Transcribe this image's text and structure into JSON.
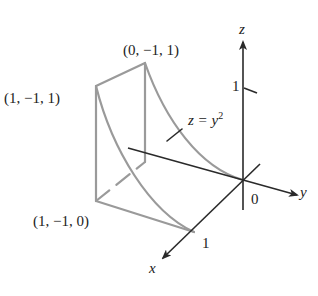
{
  "figure": {
    "type": "3d-region-sketch",
    "colors": {
      "axis": "#2a2a2a",
      "surface_edges": "#9a9a9a",
      "text": "#222222"
    }
  },
  "axes": {
    "x_label": "x",
    "y_label": "y",
    "z_label": "z",
    "origin_label": "0",
    "x_tick_label": "1",
    "z_tick_label": "1"
  },
  "points": [
    {
      "label": "(0, −1, 1)"
    },
    {
      "label": "(1, −1, 1)"
    },
    {
      "label": "(1, −1, 0)"
    }
  ],
  "surface": {
    "equation_lhs": "z = y",
    "equation_exp": "2"
  }
}
